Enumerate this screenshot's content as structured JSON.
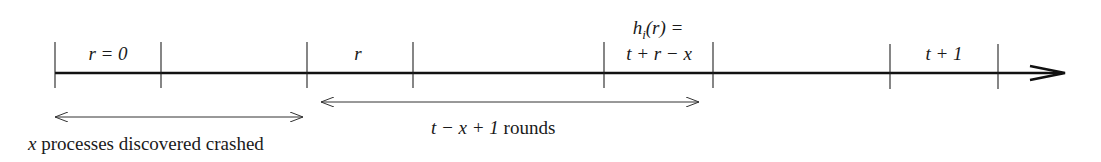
{
  "diagram": {
    "type": "timeline",
    "axis": {
      "y": 73,
      "x_start": 55,
      "x_end": 1065,
      "color": "#111111"
    },
    "ticks": [
      55,
      161,
      307,
      413,
      604,
      713,
      890,
      998
    ],
    "segment_labels": [
      {
        "id": "r0",
        "text": "r = 0",
        "center_x": 108,
        "y": 44
      },
      {
        "id": "r",
        "text": "r",
        "center_x": 357,
        "y": 44
      },
      {
        "id": "hi_line1",
        "text": "h_i(r) =",
        "center_x": 658,
        "y": 18
      },
      {
        "id": "hi_line2",
        "text": "t + r − x",
        "center_x": 658,
        "y": 44
      },
      {
        "id": "t1",
        "text": "t + 1",
        "center_x": 944,
        "y": 44
      }
    ],
    "spans": [
      {
        "id": "crashed-span",
        "x1": 55,
        "x2": 304,
        "y": 117,
        "label": "x processes discovered crashed",
        "label_x": 28,
        "label_y": 134
      },
      {
        "id": "rounds-span",
        "x1": 320,
        "x2": 700,
        "y": 102,
        "label": "t − x + 1 rounds",
        "label_x": 430,
        "label_y": 120
      }
    ]
  },
  "labels": {
    "r0": "r = 0",
    "r": "r",
    "hi_line1_h": "h",
    "hi_line1_sub": "i",
    "hi_line1_rest": "(r) =",
    "hi_line2": "t + r − x",
    "t1": "t + 1",
    "crashed_var": "x",
    "crashed_text": " processes discovered crashed",
    "rounds_math": "t − x + 1",
    "rounds_text": " rounds"
  }
}
